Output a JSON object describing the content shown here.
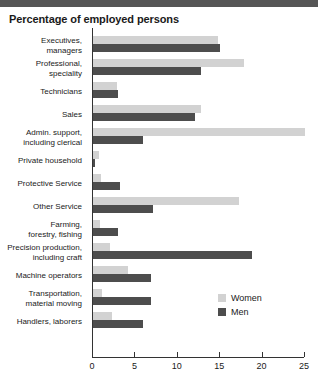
{
  "chart_data": {
    "type": "bar",
    "orientation": "horizontal",
    "title": "Percentage of employed persons",
    "xlabel": "",
    "ylabel": "",
    "xlim": [
      0,
      25
    ],
    "xticks": [
      0,
      5,
      10,
      15,
      20,
      25
    ],
    "grid": false,
    "legend_position": "inside-right",
    "colors": {
      "women": "#d2d2d2",
      "men": "#4d4d4d",
      "axis": "#333333",
      "title": "#1a1a1a",
      "top_rule": "#565656"
    },
    "categories": [
      "Executives, managers",
      "Professional, speciality",
      "Technicians",
      "Sales",
      "Admin. support, including clerical",
      "Private household",
      "Protective Service",
      "Other Service",
      "Farming, forestry, fishing",
      "Precision production, including craft",
      "Machine operators",
      "Transportation, material moving",
      "Handlers, laborers"
    ],
    "category_lines": [
      [
        "Executives,",
        "managers"
      ],
      [
        "Professional,",
        "speciality"
      ],
      [
        "Technicians"
      ],
      [
        "Sales"
      ],
      [
        "Admin. support,",
        "including clerical"
      ],
      [
        "Private household"
      ],
      [
        "Protective Service"
      ],
      [
        "Other Service"
      ],
      [
        "Farming,",
        "forestry, fishing"
      ],
      [
        "Precision production,",
        "including craft"
      ],
      [
        "Machine operators"
      ],
      [
        "Transportation,",
        "material moving"
      ],
      [
        "Handlers, laborers"
      ]
    ],
    "series": [
      {
        "name": "Women",
        "key": "women",
        "values": [
          14.9,
          17.9,
          3.0,
          12.8,
          25.1,
          0.8,
          1.1,
          17.3,
          0.9,
          2.1,
          4.3,
          1.2,
          2.3
        ]
      },
      {
        "name": "Men",
        "key": "men",
        "values": [
          15.1,
          12.9,
          3.1,
          12.1,
          6.0,
          0.4,
          3.3,
          7.2,
          3.1,
          18.9,
          7.0,
          7.0,
          6.0
        ]
      }
    ]
  },
  "legend": {
    "items": [
      {
        "label": "Women",
        "key": "women"
      },
      {
        "label": "Men",
        "key": "men"
      }
    ]
  }
}
